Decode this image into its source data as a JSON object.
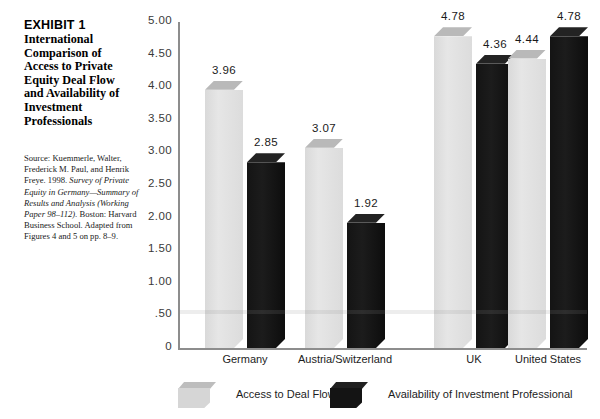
{
  "exhibit": {
    "label": "EXHIBIT 1",
    "title": "International Comparison of Access to Private Equity Deal Flow and Availability of Investment Professionals",
    "source_prefix": "Source: Kuemmerle, Walter, Frederick M. Paul, and Henrik Freye. 1998. ",
    "source_italic": "Survey of Private Equity in Germany—Summary of Results and Analysis (Working Paper 98–112).",
    "source_suffix": " Boston: Harvard Business School. Adapted from Figures 4 and 5 on pp. 8–9."
  },
  "chart_data": {
    "type": "bar",
    "title": "International Comparison of Access to Private Equity Deal Flow and Availability of Investment Professionals",
    "xlabel": "",
    "ylabel": "",
    "ylim": [
      0,
      5.0
    ],
    "grid": false,
    "legend_position": "bottom",
    "ytick_labels": [
      "5.00",
      "4.50",
      "4.00",
      "3.50",
      "3.00",
      "2.50",
      "2.00",
      "1.50",
      "1.00",
      ".50",
      "0"
    ],
    "ytick_values": [
      5.0,
      4.5,
      4.0,
      3.5,
      3.0,
      2.5,
      2.0,
      1.5,
      1.0,
      0.5,
      0
    ],
    "categories": [
      "Germany",
      "Austria/Switzerland",
      "UK",
      "United States"
    ],
    "series": [
      {
        "name": "Access to Deal Flow",
        "color": "#d9d9d9",
        "values": [
          3.96,
          3.07,
          4.78,
          4.44
        ],
        "labels": [
          "3.96",
          "3.07",
          "4.78",
          "4.44"
        ]
      },
      {
        "name": "Availability of Investment Professional",
        "color": "#141414",
        "values": [
          2.85,
          1.92,
          4.36,
          4.78
        ],
        "labels": [
          "2.85",
          "1.92",
          "4.36",
          "4.78"
        ]
      }
    ]
  }
}
